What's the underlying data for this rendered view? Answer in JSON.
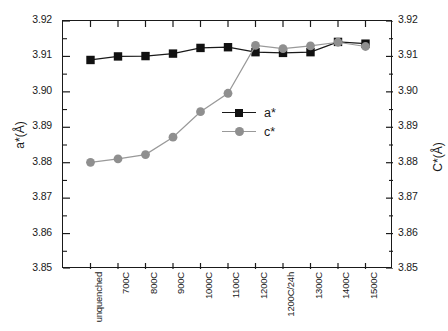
{
  "chart_data": {
    "type": "line",
    "title": "",
    "xlabel": "",
    "ylabel": "a*(Å)",
    "y2label": "C*(Å)",
    "ylim": [
      3.85,
      3.92
    ],
    "y2lim": [
      3.85,
      3.92
    ],
    "grid": false,
    "legend_position": "center",
    "categories": [
      "unquenched",
      "700C",
      "800C",
      "900C",
      "1000C",
      "1100C",
      "1200C",
      "1200C/24h",
      "1300C",
      "1400C",
      "1500C"
    ],
    "yticks": [
      "3.85",
      "3.86",
      "3.87",
      "3.88",
      "3.89",
      "3.90",
      "3.91",
      "3.92"
    ],
    "y2ticks": [
      "3.85",
      "3.86",
      "3.87",
      "3.88",
      "3.89",
      "3.90",
      "3.91",
      "3.92"
    ],
    "series": [
      {
        "name": "a*",
        "marker": "square",
        "color": "#111111",
        "line_color": "#1a1a1a",
        "values": [
          3.909,
          3.91,
          3.9101,
          3.9108,
          3.9124,
          3.9126,
          3.9112,
          3.911,
          3.9112,
          3.9141,
          3.9136
        ]
      },
      {
        "name": "c*",
        "marker": "circle",
        "color": "#8f8f8f",
        "line_color": "#999999",
        "values": [
          3.8801,
          3.8811,
          3.8823,
          3.8872,
          3.8944,
          3.8996,
          3.9131,
          3.9122,
          3.913,
          3.914,
          3.9128
        ]
      }
    ]
  },
  "legend": {
    "items": [
      {
        "label": "a*",
        "marker": "square"
      },
      {
        "label": "c*",
        "marker": "circle"
      }
    ]
  }
}
